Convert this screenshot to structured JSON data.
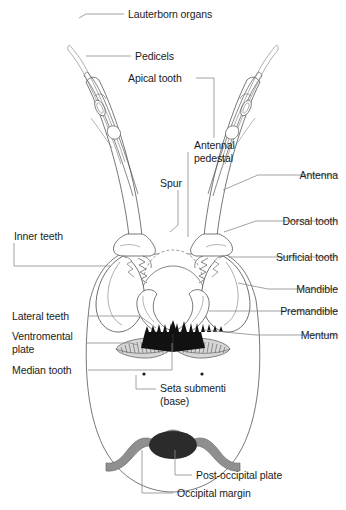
{
  "figure": {
    "background_color": "#ffffff",
    "line_color": "#4a4a4a",
    "leader_color": "#8c8c8c",
    "text_color": "#1b1b1b",
    "mentum_teeth_color": "#111111",
    "occipital_margin_color": "#8f8f8f",
    "post_occipital_plate_color": "#2b2b2b",
    "ventromental_plate_color": "#9a9a9a"
  },
  "labels": [
    {
      "id": "lauterborn-organs",
      "text": "Lauterborn organs",
      "align": "left",
      "x": 128,
      "y": 8,
      "leader": [
        [
          124,
          14
        ],
        [
          86,
          14
        ],
        [
          79,
          18
        ]
      ]
    },
    {
      "id": "pedicels",
      "text": "Pedicels",
      "align": "left",
      "x": 135,
      "y": 50,
      "leader": [
        [
          131,
          56
        ],
        [
          86,
          56
        ]
      ]
    },
    {
      "id": "apical-tooth",
      "text": "Apical tooth",
      "align": "left",
      "x": 128,
      "y": 72,
      "leader": [
        [
          196,
          78
        ],
        [
          214,
          78
        ],
        [
          214,
          138
        ]
      ]
    },
    {
      "id": "antennal-pedestal",
      "text": "Antennal\npedestal",
      "align": "left",
      "x": 194,
      "y": 139,
      "leader": [
        [
          188,
          152
        ],
        [
          188,
          237
        ]
      ]
    },
    {
      "id": "antenna",
      "text": "Antenna",
      "align": "right",
      "x": 338,
      "y": 169,
      "leader": [
        [
          338,
          175
        ],
        [
          258,
          175
        ],
        [
          223,
          190
        ]
      ]
    },
    {
      "id": "spur",
      "text": "Spur",
      "align": "left",
      "x": 160,
      "y": 177,
      "leader": [
        [
          178,
          190
        ],
        [
          178,
          225
        ],
        [
          170,
          232
        ]
      ]
    },
    {
      "id": "dorsal-tooth",
      "text": "Dorsal tooth",
      "align": "right",
      "x": 338,
      "y": 215,
      "leader": [
        [
          338,
          221
        ],
        [
          256,
          221
        ],
        [
          224,
          232
        ]
      ]
    },
    {
      "id": "inner-teeth",
      "text": "Inner teeth",
      "align": "left",
      "x": 14,
      "y": 230,
      "leader": [
        [
          14,
          243
        ],
        [
          14,
          266
        ],
        [
          110,
          266
        ]
      ]
    },
    {
      "id": "surficial-tooth",
      "text": "Surficial tooth",
      "align": "right",
      "x": 338,
      "y": 251,
      "leader": [
        [
          338,
          257
        ],
        [
          254,
          257
        ],
        [
          229,
          257
        ]
      ]
    },
    {
      "id": "mandible",
      "text": "Mandible",
      "align": "right",
      "x": 338,
      "y": 283,
      "leader": [
        [
          338,
          289
        ],
        [
          268,
          289
        ],
        [
          238,
          283
        ]
      ]
    },
    {
      "id": "premandible",
      "text": "Premandible",
      "align": "right",
      "x": 338,
      "y": 305,
      "leader": [
        [
          338,
          311
        ],
        [
          268,
          311
        ],
        [
          209,
          311
        ]
      ]
    },
    {
      "id": "lateral-teeth",
      "text": "Lateral teeth",
      "align": "left",
      "x": 12,
      "y": 310,
      "leader": [
        [
          88,
          316
        ],
        [
          140,
          316
        ],
        [
          156,
          328
        ]
      ]
    },
    {
      "id": "mentum",
      "text": "Mentum",
      "align": "right",
      "x": 338,
      "y": 329,
      "leader": [
        [
          338,
          335
        ],
        [
          256,
          335
        ],
        [
          204,
          330
        ]
      ]
    },
    {
      "id": "ventromental-plate",
      "text": "Ventromental\nplate",
      "align": "left",
      "x": 12,
      "y": 330,
      "leader": [
        [
          86,
          343
        ],
        [
          130,
          343
        ],
        [
          138,
          345
        ]
      ]
    },
    {
      "id": "median-tooth",
      "text": "Median tooth",
      "align": "left",
      "x": 12,
      "y": 364,
      "leader": [
        [
          88,
          370
        ],
        [
          172,
          370
        ],
        [
          172,
          343
        ]
      ]
    },
    {
      "id": "seta-submenti",
      "text": "Seta submenti\n(base)",
      "align": "left",
      "x": 160,
      "y": 382,
      "leader": [
        [
          156,
          389
        ],
        [
          136,
          389
        ],
        [
          136,
          375
        ]
      ]
    },
    {
      "id": "post-occipital-plate",
      "text": "Post-occipital plate",
      "align": "left",
      "x": 196,
      "y": 469,
      "leader": [
        [
          192,
          475
        ],
        [
          175,
          475
        ],
        [
          175,
          450
        ]
      ]
    },
    {
      "id": "occipital-margin",
      "text": "Occipital margin",
      "align": "left",
      "x": 177,
      "y": 487,
      "leader": [
        [
          173,
          493
        ],
        [
          142,
          493
        ],
        [
          142,
          450
        ]
      ]
    }
  ],
  "anatomy": {
    "parts": [
      "antenna-left",
      "antenna-right",
      "lauterborn-organ-left",
      "lauterborn-organ-right",
      "pedicel-left",
      "pedicel-right",
      "antennal-pedestal-left",
      "antennal-pedestal-right",
      "mandible-left",
      "mandible-right",
      "premandible-left",
      "premandible-right",
      "mentum-teeth",
      "ventromental-plate-left",
      "ventromental-plate-right",
      "seta-submenti-left",
      "seta-submenti-right",
      "occipital-margin",
      "post-occipital-plate",
      "head-capsule-outline"
    ]
  }
}
